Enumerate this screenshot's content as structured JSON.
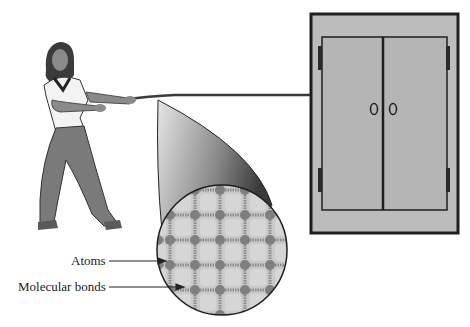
{
  "figure": {
    "labels": {
      "atoms": "Atoms",
      "molecular_bonds": "Molecular bonds"
    },
    "elements": {
      "person": "woman-pulling-rope",
      "rope": "rope",
      "cabinet": "double-door-cabinet",
      "magnifier": "magnified-rope-cross-section"
    },
    "colors": {
      "cabinet_fill": "#b9b9b9",
      "outline": "#1e1e1e",
      "atom": "#7f7f7f",
      "lattice_cell": "#d3d3d3",
      "pants": "#7a7a7a"
    }
  }
}
